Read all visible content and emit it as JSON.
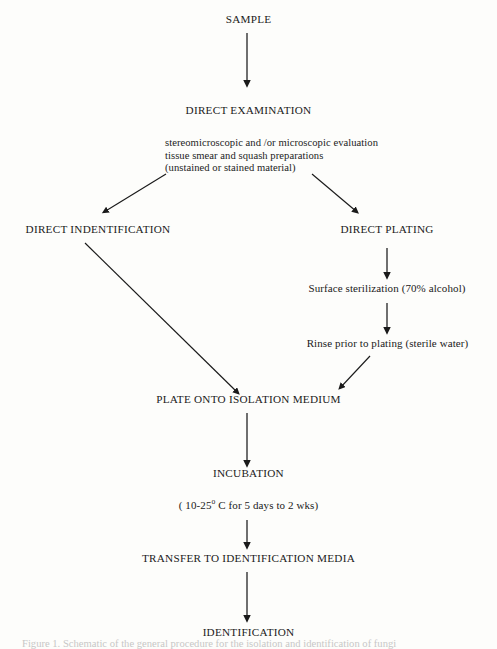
{
  "diagram": {
    "title_node": "SAMPLE",
    "type": "flowchart",
    "nodes": {
      "sample": "SAMPLE",
      "direct_examination": "DIRECT EXAMINATION",
      "direct_identification": "DIRECT INDENTIFICATION",
      "direct_plating": "DIRECT PLATING",
      "surface_sterilization": "Surface sterilization (70% alcohol)",
      "rinse": "Rinse prior to plating (sterile water)",
      "plate_onto_isolation_medium": "PLATE ONTO ISOLATION MEDIUM",
      "incubation": "INCUBATION",
      "incubation_detail_prefix": "( 10-25",
      "incubation_detail_degree": "o",
      "incubation_detail_suffix": " C for 5 days to 2 wks)",
      "transfer": "TRANSFER TO IDENTIFICATION MEDIA",
      "identification": "IDENTIFICATION"
    },
    "examination_details": [
      "stereomicroscopic and /or microscopic evaluation",
      "tissue smear and squash preparations",
      "(unstained or stained material)"
    ],
    "caption_partial": "Figure 1. Schematic of the general procedure for the isolation and identification of fungi",
    "colors": {
      "background": "#fdfdfb",
      "text": "#1a1a1a",
      "arrow": "#1a1a1a"
    }
  }
}
